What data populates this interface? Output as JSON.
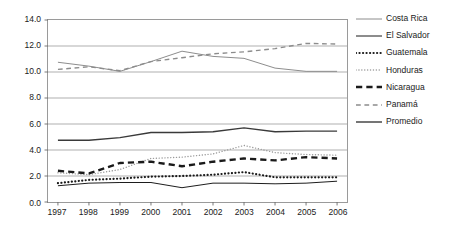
{
  "chart_data": {
    "type": "line",
    "title": "",
    "xlabel": "",
    "ylabel": "",
    "x": [
      1997,
      1998,
      1999,
      2000,
      2001,
      2002,
      2003,
      2004,
      2005,
      2006
    ],
    "categories": [
      "1997",
      "1998",
      "1999",
      "2000",
      "2001",
      "2002",
      "2003",
      "2004",
      "2005",
      "2006"
    ],
    "ylim": [
      0.0,
      14.0
    ],
    "yticks": [
      0.0,
      2.0,
      4.0,
      6.0,
      8.0,
      10.0,
      12.0,
      14.0
    ],
    "ytick_labels": [
      "0.0",
      "2.0",
      "4.0",
      "6.0",
      "8.0",
      "10.0",
      "12.0",
      "14.0"
    ],
    "grid": "horizontal",
    "legend_position": "right",
    "series": [
      {
        "name": "Costa Rica",
        "style": "solid",
        "color": "#8c8c8c",
        "width": 1.0,
        "values": [
          10.75,
          10.45,
          10.05,
          10.8,
          11.6,
          11.2,
          11.05,
          10.3,
          10.05,
          10.05
        ]
      },
      {
        "name": "El Salvador",
        "style": "solid",
        "color": "#1a1a1a",
        "width": 1.0,
        "values": [
          1.25,
          1.45,
          1.5,
          1.5,
          1.1,
          1.45,
          1.45,
          1.4,
          1.45,
          1.6
        ]
      },
      {
        "name": "Guatemala",
        "style": "dotted",
        "color": "#1a1a1a",
        "width": 2.2,
        "values": [
          1.45,
          1.7,
          1.8,
          1.95,
          2.0,
          2.1,
          2.3,
          1.9,
          1.9,
          1.9
        ]
      },
      {
        "name": "Honduras",
        "style": "dotted",
        "color": "#9a9a9a",
        "width": 1.4,
        "values": [
          2.25,
          2.1,
          2.5,
          3.35,
          3.45,
          3.7,
          4.35,
          3.8,
          3.65,
          3.6
        ]
      },
      {
        "name": "Nicaragua",
        "style": "dashed",
        "color": "#1a1a1a",
        "width": 2.4,
        "values": [
          2.4,
          2.2,
          3.0,
          3.1,
          2.75,
          3.1,
          3.35,
          3.2,
          3.45,
          3.35
        ]
      },
      {
        "name": "Panamá",
        "style": "dashed",
        "color": "#8c8c8c",
        "width": 1.4,
        "values": [
          10.2,
          10.4,
          10.1,
          10.8,
          11.1,
          11.4,
          11.55,
          11.8,
          12.2,
          12.15
        ]
      },
      {
        "name": "Promedio",
        "style": "solid",
        "color": "#3a3a3a",
        "width": 1.4,
        "values": [
          4.75,
          4.75,
          4.95,
          5.35,
          5.35,
          5.4,
          5.7,
          5.4,
          5.45,
          5.45
        ]
      }
    ]
  },
  "legend": {
    "items": [
      {
        "label": "Costa Rica"
      },
      {
        "label": "El Salvador"
      },
      {
        "label": "Guatemala"
      },
      {
        "label": "Honduras"
      },
      {
        "label": "Nicaragua"
      },
      {
        "label": "Panamá"
      },
      {
        "label": "Promedio"
      }
    ]
  }
}
